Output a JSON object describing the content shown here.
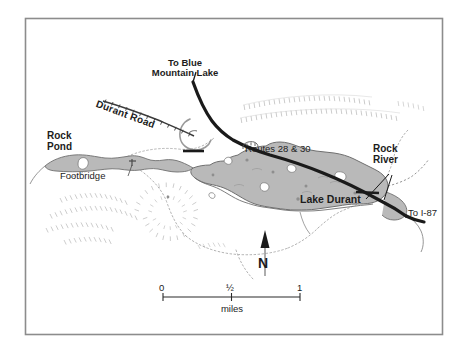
{
  "map": {
    "title_labels": {
      "lake": "Lake Durant",
      "rock_pond": "Rock\nPond",
      "rock_river": "Rock\nRiver",
      "footbridge": "Footbridge",
      "durant_road": "Durant Road",
      "routes": "Routes 28 & 30",
      "to_blue_mountain_lake": "To Blue\nMountain Lake",
      "to_i87": "To I-87"
    },
    "compass": {
      "letter": "N",
      "name": "north-arrow"
    },
    "scale_bar": {
      "ticks": [
        "0",
        "½",
        "1"
      ],
      "units": "miles"
    },
    "colors": {
      "water_fill": "#b9b9b9",
      "water_outline": "#6b6b6b",
      "road": "#1a1a1a",
      "trail": "#9a9a9a",
      "hachure": "#c2c2c2",
      "frame": "#8c8c8c",
      "text": "#1c1c1c",
      "background": "#ffffff"
    },
    "frame": {
      "x": 25,
      "y": 18,
      "width": 418,
      "height": 317
    }
  }
}
